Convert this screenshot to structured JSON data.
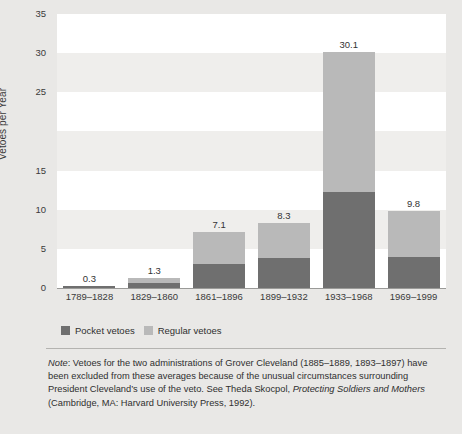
{
  "chart_data": {
    "type": "bar",
    "stacked": true,
    "title": "",
    "xlabel": "",
    "ylabel": "Vetoes per Year",
    "ylim": [
      0,
      35
    ],
    "ytick_values": [
      0,
      5,
      10,
      15,
      25,
      30,
      35
    ],
    "ytick_labels": [
      "0",
      "5",
      "10",
      "15",
      "25",
      "30",
      "35"
    ],
    "grid": "alternating horizontal bands",
    "legend_position": "below-plot-left",
    "categories": [
      "1789–1828",
      "1829–1860",
      "1861–1896",
      "1899–1932",
      "1933–1968",
      "1969–1999"
    ],
    "series": [
      {
        "name": "Pocket vetoes",
        "color": "#6f6f6f",
        "values": [
          0.3,
          0.6,
          3.1,
          3.8,
          12.3,
          4.0
        ]
      },
      {
        "name": "Regular vetoes",
        "color": "#b9b9b9",
        "values": [
          0.0,
          0.7,
          4.0,
          4.5,
          17.8,
          5.8
        ]
      }
    ],
    "totals": [
      0.3,
      1.3,
      7.1,
      8.3,
      30.1,
      9.8
    ],
    "total_labels": [
      "0.3",
      "1.3",
      "7.1",
      "8.3",
      "30.1",
      "9.8"
    ]
  },
  "axis": {
    "y_title": "Vetoes per Year"
  },
  "legend": {
    "items": [
      {
        "label": "Pocket vetoes",
        "color": "#6f6f6f"
      },
      {
        "label": "Regular vetoes",
        "color": "#b9b9b9"
      }
    ]
  },
  "note": {
    "lead": "Note",
    "text_part1": ": Vetoes for the two administrations of Grover Cleveland (1885–1889, 1893–1897) have been excluded from these averages because of the unusual circumstances surrounding President Cleveland’s use of the veto. See Theda Skocpol, ",
    "italic_title": "Protecting Soldiers and Mothers",
    "text_part2": " (Cambridge, MA: Harvard University Press, 1992)."
  },
  "colors": {
    "page_background": "#e9e8e6",
    "band_light": "#ffffff",
    "band_grey": "#efeeec",
    "pocket": "#6f6f6f",
    "regular": "#b9b9b9",
    "rule": "#b4b3b0",
    "text": "#3a3a3a"
  }
}
